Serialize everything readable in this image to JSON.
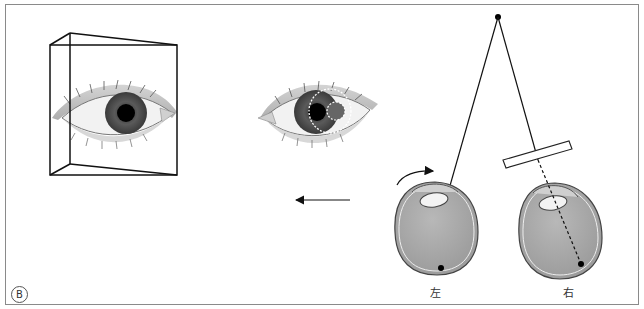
{
  "figure": {
    "panel_label": "B",
    "eye_labels": {
      "left": "左",
      "right": "右"
    },
    "colors": {
      "frame": "#8a8a8a",
      "line": "#111111",
      "eyeball_fill": "#a9a9a9",
      "iris": "#555555",
      "pupil": "#000000",
      "sclera": "#f2f2f2"
    },
    "elements": [
      "prism-box-framed-eye",
      "eye-with-dashed-displaced-iris",
      "leftward-arrow",
      "fixation-point",
      "left-eyeball-with-rotation-arrow",
      "right-eyeball-with-prism"
    ]
  }
}
